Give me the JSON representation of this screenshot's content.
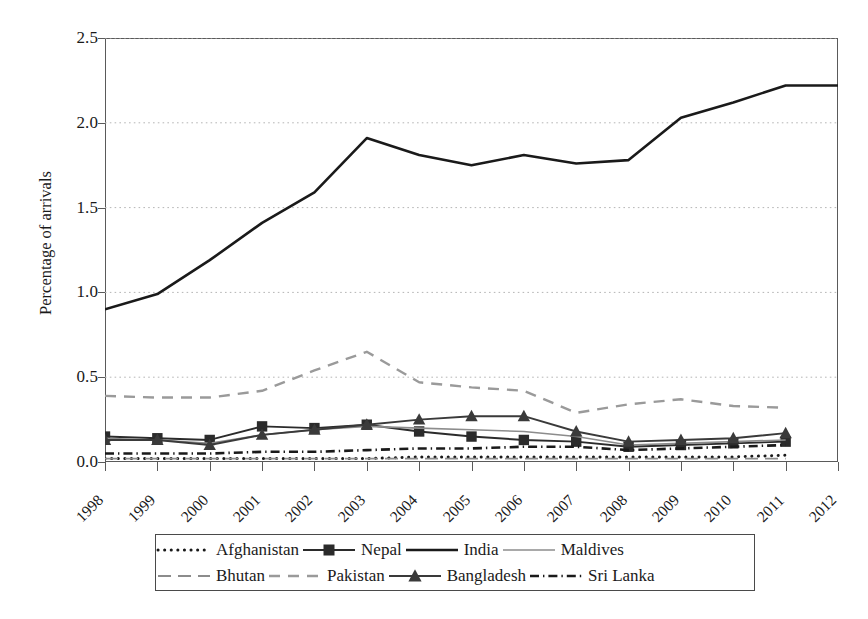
{
  "chart_data": {
    "type": "line",
    "title": "",
    "xlabel": "",
    "ylabel": "Percentage of arrivals",
    "categories": [
      1998,
      1999,
      2000,
      2001,
      2002,
      2003,
      2004,
      2005,
      2006,
      2007,
      2008,
      2009,
      2010,
      2011,
      2012
    ],
    "x_tick_labels": [
      "1998",
      "1999",
      "2000",
      "2001",
      "2002",
      "2003",
      "2004",
      "2005",
      "2006",
      "2007",
      "2008",
      "2009",
      "2010",
      "2011",
      "2012"
    ],
    "y_tick_labels": [
      "0.0",
      "0.5",
      "1.0",
      "1.5",
      "2.0",
      "2.5"
    ],
    "y_tick_values": [
      0.0,
      0.5,
      1.0,
      1.5,
      2.0,
      2.5
    ],
    "ylim": [
      0.0,
      2.5
    ],
    "xlim": [
      1998,
      2012
    ],
    "grid": "horizontal-dotted",
    "legend_position": "below-axis",
    "series": [
      {
        "name": "Afghanistan",
        "style": "dotted",
        "marker": "none",
        "color": "#1a1a1a",
        "x": [
          1998,
          1999,
          2000,
          2001,
          2002,
          2003,
          2004,
          2005,
          2006,
          2007,
          2008,
          2009,
          2010,
          2011
        ],
        "values": [
          0.02,
          0.02,
          0.02,
          0.02,
          0.02,
          0.02,
          0.03,
          0.03,
          0.03,
          0.03,
          0.03,
          0.03,
          0.03,
          0.04
        ]
      },
      {
        "name": "Nepal",
        "style": "solid",
        "marker": "square",
        "color": "#2b2b2b",
        "x": [
          1998,
          1999,
          2000,
          2001,
          2002,
          2003,
          2004,
          2005,
          2006,
          2007,
          2008,
          2009,
          2010,
          2011
        ],
        "values": [
          0.15,
          0.14,
          0.13,
          0.21,
          0.2,
          0.22,
          0.18,
          0.15,
          0.13,
          0.12,
          0.09,
          0.1,
          0.11,
          0.12
        ]
      },
      {
        "name": "India",
        "style": "solid-thick",
        "marker": "none",
        "color": "#1a1a1a",
        "x": [
          1998,
          1999,
          2000,
          2001,
          2002,
          2003,
          2004,
          2005,
          2006,
          2007,
          2008,
          2009,
          2010,
          2011,
          2012
        ],
        "values": [
          0.9,
          0.99,
          1.19,
          1.41,
          1.59,
          1.91,
          1.81,
          1.75,
          1.81,
          1.76,
          1.78,
          2.03,
          2.12,
          2.22,
          2.22
        ]
      },
      {
        "name": "Maldives",
        "style": "solid-thin",
        "marker": "none",
        "color": "#8c8c8c",
        "x": [
          1998,
          1999,
          2000,
          2001,
          2002,
          2003,
          2004,
          2005,
          2006,
          2007,
          2008,
          2009,
          2010,
          2011
        ],
        "values": [
          0.14,
          0.13,
          0.11,
          0.16,
          0.19,
          0.21,
          0.2,
          0.19,
          0.18,
          0.15,
          0.1,
          0.11,
          0.12,
          0.13
        ]
      },
      {
        "name": "Bhutan",
        "style": "long-dash",
        "marker": "none",
        "color": "#8c8c8c",
        "x": [
          1998,
          1999,
          2000,
          2001,
          2002,
          2003,
          2004,
          2005,
          2006,
          2007,
          2008,
          2009,
          2010,
          2011
        ],
        "values": [
          0.02,
          0.02,
          0.02,
          0.02,
          0.02,
          0.02,
          0.02,
          0.02,
          0.02,
          0.02,
          0.02,
          0.02,
          0.02,
          0.02
        ]
      },
      {
        "name": "Pakistan",
        "style": "dashed",
        "marker": "none",
        "color": "#9a9a9a",
        "x": [
          1998,
          1999,
          2000,
          2001,
          2002,
          2003,
          2004,
          2005,
          2006,
          2007,
          2008,
          2009,
          2010,
          2011
        ],
        "values": [
          0.39,
          0.38,
          0.38,
          0.42,
          0.54,
          0.65,
          0.47,
          0.44,
          0.42,
          0.29,
          0.34,
          0.37,
          0.33,
          0.32
        ]
      },
      {
        "name": "Bangladesh",
        "style": "solid",
        "marker": "triangle",
        "color": "#3a3a3a",
        "x": [
          1998,
          1999,
          2000,
          2001,
          2002,
          2003,
          2004,
          2005,
          2006,
          2007,
          2008,
          2009,
          2010,
          2011
        ],
        "values": [
          0.13,
          0.13,
          0.1,
          0.16,
          0.19,
          0.22,
          0.25,
          0.27,
          0.27,
          0.18,
          0.12,
          0.13,
          0.14,
          0.17
        ]
      },
      {
        "name": "Sri Lanka",
        "style": "dash-dot",
        "marker": "none",
        "color": "#1a1a1a",
        "x": [
          1998,
          1999,
          2000,
          2001,
          2002,
          2003,
          2004,
          2005,
          2006,
          2007,
          2008,
          2009,
          2010,
          2011
        ],
        "values": [
          0.05,
          0.05,
          0.05,
          0.06,
          0.06,
          0.07,
          0.08,
          0.08,
          0.09,
          0.09,
          0.07,
          0.08,
          0.09,
          0.1
        ]
      }
    ]
  },
  "legend": {
    "rows": [
      [
        "Afghanistan",
        "Nepal",
        "India",
        "Maldives"
      ],
      [
        "Bhutan",
        "Pakistan",
        "Bangladesh",
        "Sri Lanka"
      ]
    ]
  }
}
